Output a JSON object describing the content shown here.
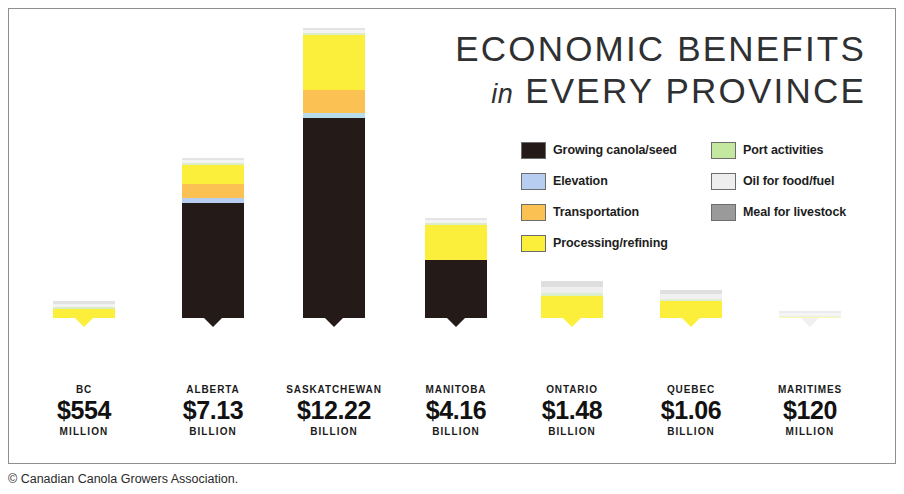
{
  "title": {
    "line1": "ECONOMIC BENEFITS",
    "in_word": "in",
    "line2": "EVERY PROVINCE"
  },
  "caption": "© Canadian Canola Growers Association.",
  "legend": {
    "left": [
      {
        "label": "Growing canola/seed",
        "color": "#241a18"
      },
      {
        "label": "Elevation",
        "color": "#b8cef0"
      },
      {
        "label": "Transportation",
        "color": "#fbc253"
      },
      {
        "label": "Processing/refining",
        "color": "#fbef3c"
      }
    ],
    "right": [
      {
        "label": "Port activities",
        "color": "#c4e8a0"
      },
      {
        "label": "Oil for food/fuel",
        "color": "#eeeeee"
      },
      {
        "label": "Meal for livestock",
        "color": "#9a9a9a"
      }
    ]
  },
  "chart_data": {
    "type": "bar",
    "subtype": "stacked",
    "title": "ECONOMIC BENEFITS in EVERY PROVINCE",
    "xlabel": "",
    "ylabel": "",
    "grid": false,
    "legend_position": "top-right",
    "categories": [
      "BC",
      "ALBERTA",
      "SASKATCHEWAN",
      "MANITOBA",
      "ONTARIO",
      "QUEBEC",
      "MARITIMES"
    ],
    "value_labels": [
      "$554",
      "$7.13",
      "$12.22",
      "$4.16",
      "$1.48",
      "$1.06",
      "$120"
    ],
    "value_units": [
      "MILLION",
      "BILLION",
      "BILLION",
      "BILLION",
      "BILLION",
      "BILLION",
      "MILLION"
    ],
    "values": [
      0.554,
      7.13,
      12.22,
      4.16,
      1.48,
      1.06,
      0.12
    ],
    "value_unit_scale": "billions CAD",
    "series": [
      {
        "name": "Growing canola/seed",
        "color": "#241a18",
        "values": [
          0,
          4.55,
          8.3,
          2.4,
          0,
          0,
          0
        ]
      },
      {
        "name": "Elevation",
        "color": "#b8cef0",
        "values": [
          0,
          0.18,
          0.26,
          0,
          0,
          0,
          0
        ]
      },
      {
        "name": "Transportation",
        "color": "#fbc253",
        "values": [
          0,
          0.55,
          0.95,
          0,
          0,
          0,
          0
        ]
      },
      {
        "name": "Processing/refining",
        "color": "#fbef3c",
        "values": [
          0.33,
          1.55,
          2.4,
          1.55,
          0.95,
          0.72,
          0
        ]
      },
      {
        "name": "Port activities",
        "color": "#c4e8a0",
        "values": [
          0.05,
          0.1,
          0.12,
          0.06,
          0.05,
          0.04,
          0.02
        ]
      },
      {
        "name": "Oil for food/fuel",
        "color": "#eeeeee",
        "values": [
          0.09,
          0.12,
          0.12,
          0.09,
          0.24,
          0.18,
          0.05
        ]
      },
      {
        "name": "Meal for livestock",
        "color": "#9a9a9a",
        "values": [
          0.08,
          0.08,
          0.07,
          0.06,
          0.24,
          0.12,
          0.05
        ]
      }
    ]
  },
  "bars": [
    {
      "name": "BC",
      "value": "$554",
      "unit": "MILLION",
      "left": 45,
      "segments": [
        {
          "series": "Growing canola/seed",
          "color": "#241a18",
          "h": 0
        },
        {
          "series": "Elevation",
          "color": "#b8cef0",
          "h": 0
        },
        {
          "series": "Transportation",
          "color": "#fbc253",
          "h": 0
        },
        {
          "series": "Processing/refining",
          "color": "#fbef3c",
          "h": 9
        },
        {
          "series": "Port activities",
          "color": "#d9ecc6",
          "h": 2
        },
        {
          "series": "Oil for food/fuel",
          "color": "#f2f2f2",
          "h": 3
        },
        {
          "series": "Meal for livestock",
          "color": "#e2e2e2",
          "h": 3
        }
      ],
      "pointer_color": "#fbef3c"
    },
    {
      "name": "ALBERTA",
      "value": "$7.13",
      "unit": "BILLION",
      "left": 174,
      "segments": [
        {
          "series": "Growing canola/seed",
          "color": "#241a18",
          "h": 115
        },
        {
          "series": "Elevation",
          "color": "#b8cef0",
          "h": 5
        },
        {
          "series": "Transportation",
          "color": "#fbc253",
          "h": 14
        },
        {
          "series": "Processing/refining",
          "color": "#fbef3c",
          "h": 19
        },
        {
          "series": "Port activities",
          "color": "#dcedca",
          "h": 2
        },
        {
          "series": "Oil for food/fuel",
          "color": "#f3f3f3",
          "h": 3
        },
        {
          "series": "Meal for livestock",
          "color": "#e4e4e4",
          "h": 2
        }
      ],
      "pointer_color": "#241a18"
    },
    {
      "name": "SASKATCHEWAN",
      "value": "$12.22",
      "unit": "BILLION",
      "left": 295,
      "segments": [
        {
          "series": "Growing canola/seed",
          "color": "#241a18",
          "h": 200
        },
        {
          "series": "Elevation",
          "color": "#b8dcec",
          "h": 5
        },
        {
          "series": "Transportation",
          "color": "#fbc253",
          "h": 23
        },
        {
          "series": "Processing/refining",
          "color": "#fbef3c",
          "h": 55
        },
        {
          "series": "Port activities",
          "color": "#dcedca",
          "h": 2
        },
        {
          "series": "Oil for food/fuel",
          "color": "#f3f3f3",
          "h": 3
        },
        {
          "series": "Meal for livestock",
          "color": "#e4e4e4",
          "h": 2
        }
      ],
      "pointer_color": "#241a18"
    },
    {
      "name": "MANITOBA",
      "value": "$4.16",
      "unit": "BILLION",
      "left": 417,
      "segments": [
        {
          "series": "Growing canola/seed",
          "color": "#241a18",
          "h": 58
        },
        {
          "series": "Elevation",
          "color": "#b8cef0",
          "h": 0
        },
        {
          "series": "Transportation",
          "color": "#fbc253",
          "h": 0
        },
        {
          "series": "Processing/refining",
          "color": "#fbef3c",
          "h": 35
        },
        {
          "series": "Port activities",
          "color": "#dcedca",
          "h": 2
        },
        {
          "series": "Oil for food/fuel",
          "color": "#f3f3f3",
          "h": 3
        },
        {
          "series": "Meal for livestock",
          "color": "#e4e4e4",
          "h": 2
        }
      ],
      "pointer_color": "#241a18"
    },
    {
      "name": "ONTARIO",
      "value": "$1.48",
      "unit": "BILLION",
      "left": 533,
      "segments": [
        {
          "series": "Growing canola/seed",
          "color": "#241a18",
          "h": 0
        },
        {
          "series": "Elevation",
          "color": "#b8cef0",
          "h": 0
        },
        {
          "series": "Transportation",
          "color": "#fbc253",
          "h": 0
        },
        {
          "series": "Processing/refining",
          "color": "#fbef3c",
          "h": 22
        },
        {
          "series": "Port activities",
          "color": "#dcedca",
          "h": 3
        },
        {
          "series": "Oil for food/fuel",
          "color": "#efefef",
          "h": 6
        },
        {
          "series": "Meal for livestock",
          "color": "#dedede",
          "h": 6
        }
      ],
      "pointer_color": "#fbef3c"
    },
    {
      "name": "QUEBEC",
      "value": "$1.06",
      "unit": "BILLION",
      "left": 652,
      "segments": [
        {
          "series": "Growing canola/seed",
          "color": "#241a18",
          "h": 0
        },
        {
          "series": "Elevation",
          "color": "#b8cef0",
          "h": 0
        },
        {
          "series": "Transportation",
          "color": "#fbc253",
          "h": 0
        },
        {
          "series": "Processing/refining",
          "color": "#fbef3c",
          "h": 17
        },
        {
          "series": "Port activities",
          "color": "#e0efd0",
          "h": 2
        },
        {
          "series": "Oil for food/fuel",
          "color": "#f1f1f1",
          "h": 5
        },
        {
          "series": "Meal for livestock",
          "color": "#e0e0e0",
          "h": 4
        }
      ],
      "pointer_color": "#fbef3c"
    },
    {
      "name": "MARITIMES",
      "value": "$120",
      "unit": "MILLION",
      "left": 771,
      "segments": [
        {
          "series": "Growing canola/seed",
          "color": "#241a18",
          "h": 0
        },
        {
          "series": "Elevation",
          "color": "#b8cef0",
          "h": 0
        },
        {
          "series": "Transportation",
          "color": "#fbc253",
          "h": 0
        },
        {
          "series": "Processing/refining",
          "color": "#fdf7b8",
          "h": 1
        },
        {
          "series": "Port activities",
          "color": "#e8f2de",
          "h": 1
        },
        {
          "series": "Oil for food/fuel",
          "color": "#f5f5f5",
          "h": 3
        },
        {
          "series": "Meal for livestock",
          "color": "#ececec",
          "h": 2
        }
      ],
      "pointer_color": "#f0f0f0"
    }
  ],
  "label_positions": [
    16,
    145,
    266,
    388,
    504,
    623,
    742
  ]
}
